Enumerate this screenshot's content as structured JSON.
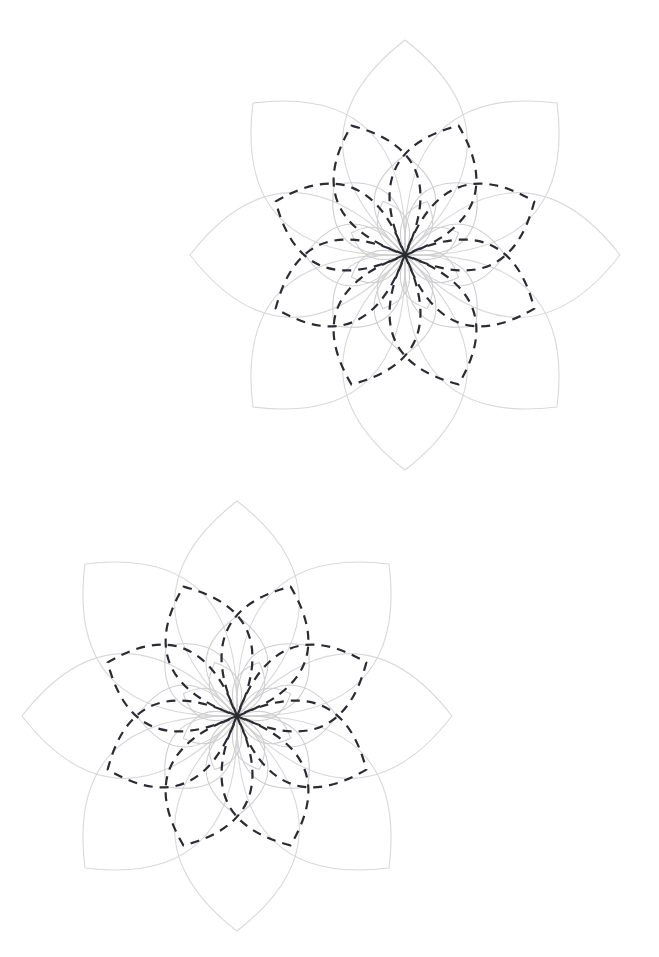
{
  "page": {
    "width": 659,
    "height": 957,
    "background_color": "#ffffff"
  },
  "colors": {
    "light_stroke": "#d9d9d9",
    "light_stroke_inner": "#cfcfcf",
    "dashed_stroke": "#2b2b33",
    "background": "#ffffff"
  },
  "style": {
    "light_stroke_width": 1.1,
    "inner_stroke_width": 1.1,
    "dashed_stroke_width": 2.2,
    "dash_pattern": "9 7",
    "dash_pattern_short": "8 6"
  },
  "chart_data": {
    "type": "diagram",
    "figure_count": 2,
    "petal_count": 8,
    "layer_count": 3,
    "figures": [
      {
        "name": "top-rosette",
        "center": {
          "x": 405,
          "y": 255
        },
        "extent": {
          "top_tip": {
            "x": 405,
            "y": 40
          },
          "bottom_tip": {
            "x": 405,
            "y": 470
          },
          "left_tip": {
            "x": 189,
            "y": 254
          },
          "right_tip": {
            "x": 622,
            "y": 254
          }
        },
        "layers": [
          {
            "name": "outer-light-rosette",
            "radius": 215,
            "bulge": 0.58,
            "rotation_deg": 0,
            "stroke": "#d9d9d9",
            "dashed": false,
            "petals": 8
          },
          {
            "name": "middle-dashed-rosette",
            "radius": 140,
            "bulge": 0.6,
            "rotation_deg": 22.5,
            "stroke": "#2b2b33",
            "dashed": true,
            "petals": 8
          },
          {
            "name": "inner-light-rosette",
            "radius": 100,
            "bulge": 0.62,
            "rotation_deg": 0,
            "stroke": "#cfcfcf",
            "dashed": false,
            "petals": 8
          },
          {
            "name": "core-light-rosette",
            "radius": 58,
            "bulge": 0.52,
            "rotation_deg": 22.5,
            "stroke": "#cfcfcf",
            "dashed": false,
            "petals": 8
          }
        ]
      },
      {
        "name": "bottom-rosette",
        "center": {
          "x": 237,
          "y": 716
        },
        "extent": {
          "top_tip": {
            "x": 237,
            "y": 502
          },
          "bottom_tip": {
            "x": 237,
            "y": 931
          },
          "left_tip": {
            "x": 22,
            "y": 715
          },
          "right_tip": {
            "x": 452,
            "y": 715
          }
        },
        "layers": [
          {
            "name": "outer-light-rosette",
            "radius": 215,
            "bulge": 0.58,
            "rotation_deg": 0,
            "stroke": "#d9d9d9",
            "dashed": false,
            "petals": 8
          },
          {
            "name": "middle-dashed-rosette",
            "radius": 140,
            "bulge": 0.6,
            "rotation_deg": 22.5,
            "stroke": "#2b2b33",
            "dashed": true,
            "petals": 8
          },
          {
            "name": "inner-light-rosette",
            "radius": 100,
            "bulge": 0.62,
            "rotation_deg": 0,
            "stroke": "#cfcfcf",
            "dashed": false,
            "petals": 8
          },
          {
            "name": "core-light-rosette",
            "radius": 58,
            "bulge": 0.52,
            "rotation_deg": 22.5,
            "stroke": "#cfcfcf",
            "dashed": false,
            "petals": 8
          }
        ]
      }
    ]
  }
}
